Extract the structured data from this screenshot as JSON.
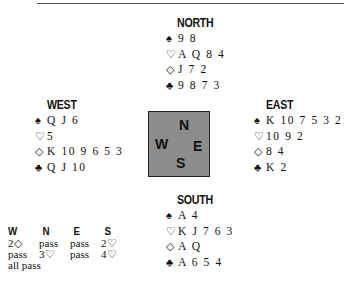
{
  "hands": {
    "north": {
      "title": "NORTH",
      "spades": "9 8",
      "hearts": "A Q 8 4",
      "diamonds": "J 7 2",
      "clubs": "9 8 7 3"
    },
    "west": {
      "title": "WEST",
      "spades": "Q J 6",
      "hearts": "5",
      "diamonds": "K 10 9 6 5 3",
      "clubs": "Q J 10"
    },
    "east": {
      "title": "EAST",
      "spades": "K 10 7 5 3 2",
      "hearts": "10 9 2",
      "diamonds": "8 4",
      "clubs": "K 2"
    },
    "south": {
      "title": "SOUTH",
      "spades": "A 4",
      "hearts": "K J 7 6 3",
      "diamonds": "A Q",
      "clubs": "A 6 5 4"
    }
  },
  "suit_symbols": {
    "spades": "♠",
    "hearts": "♡",
    "diamonds": "◇",
    "clubs": "♣"
  },
  "compass": {
    "n": "N",
    "w": "W",
    "e": "E",
    "s": "S",
    "fill": "#8c8c8c"
  },
  "bidding": {
    "headers": [
      "W",
      "N",
      "E",
      "S"
    ],
    "rows": [
      [
        "2◇",
        "pass",
        "pass",
        "2♡"
      ],
      [
        "pass",
        "3♡",
        "pass",
        "4♡"
      ],
      [
        "all pass",
        "",
        "",
        ""
      ]
    ]
  }
}
